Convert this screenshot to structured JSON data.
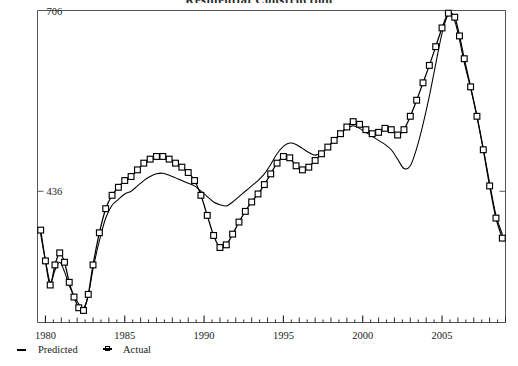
{
  "title": "Residential Construction",
  "legend": {
    "items": [
      {
        "label": "Predicted",
        "marker": "dash-marker",
        "color": "#000000"
      },
      {
        "label": "Actual",
        "marker": "square-marker",
        "color": "#000000"
      }
    ]
  },
  "axes": {
    "y_ticks": [
      "706",
      "436"
    ],
    "x_ticks": [
      "1980",
      "1985",
      "1990",
      "1995",
      "2000",
      "2005"
    ]
  },
  "chart_data": {
    "type": "line",
    "title": "Residential Construction",
    "xlabel": "",
    "ylabel": "",
    "xlim": [
      1979.5,
      2009.0
    ],
    "ylim": [
      240,
      706
    ],
    "ytick_values": [
      436,
      706
    ],
    "ytick_labels": [
      "436",
      "706"
    ],
    "xtick_values": [
      1980,
      1985,
      1990,
      1995,
      2000,
      2005
    ],
    "xtick_labels": [
      "1980",
      "1985",
      "1990",
      "1995",
      "2000",
      "2005"
    ],
    "minor_ticks": true,
    "grid": false,
    "legend_position": "below-left",
    "series": [
      {
        "name": "Predicted",
        "marker": "none",
        "color": "#000000",
        "x": [
          1979.7,
          1980.0,
          1980.3,
          1980.6,
          1980.9,
          1981.2,
          1981.5,
          1981.8,
          1982.1,
          1982.4,
          1982.7,
          1983.0,
          1983.4,
          1983.8,
          1984.2,
          1984.6,
          1985.0,
          1985.4,
          1985.8,
          1986.2,
          1986.6,
          1987.0,
          1987.4,
          1987.8,
          1988.2,
          1988.6,
          1989.0,
          1989.4,
          1989.8,
          1990.2,
          1990.6,
          1991.0,
          1991.4,
          1991.8,
          1992.2,
          1992.6,
          1993.0,
          1993.4,
          1993.8,
          1994.2,
          1994.6,
          1995.0,
          1995.4,
          1995.8,
          1996.2,
          1996.6,
          1997.0,
          1997.4,
          1997.8,
          1998.2,
          1998.6,
          1999.0,
          1999.4,
          1999.8,
          2000.2,
          2000.6,
          2001.0,
          2001.4,
          2001.8,
          2002.2,
          2002.6,
          2003.0,
          2003.4,
          2003.8,
          2004.2,
          2004.6,
          2005.0,
          2005.4,
          2005.8,
          2006.1,
          2006.4,
          2006.8,
          2007.2,
          2007.6,
          2008.0,
          2008.4,
          2008.8
        ],
        "y": [
          372,
          333,
          300,
          318,
          330,
          316,
          295,
          280,
          268,
          262,
          280,
          320,
          362,
          396,
          415,
          424,
          432,
          436,
          444,
          452,
          458,
          462,
          463,
          460,
          456,
          452,
          448,
          444,
          436,
          428,
          420,
          416,
          414,
          420,
          428,
          436,
          444,
          452,
          462,
          476,
          492,
          503,
          508,
          506,
          500,
          494,
          490,
          494,
          502,
          512,
          522,
          530,
          534,
          530,
          524,
          518,
          512,
          506,
          498,
          484,
          470,
          474,
          500,
          536,
          578,
          626,
          672,
          700,
          690,
          662,
          628,
          590,
          548,
          500,
          448,
          400,
          372
        ]
      },
      {
        "name": "Actual",
        "marker": "square",
        "color": "#000000",
        "x": [
          1979.7,
          1980.0,
          1980.3,
          1980.6,
          1980.9,
          1981.2,
          1981.5,
          1981.8,
          1982.1,
          1982.4,
          1982.7,
          1983.0,
          1983.4,
          1983.8,
          1984.2,
          1984.6,
          1985.0,
          1985.4,
          1985.8,
          1986.2,
          1986.6,
          1987.0,
          1987.4,
          1987.8,
          1988.2,
          1988.6,
          1989.0,
          1989.4,
          1989.8,
          1990.2,
          1990.6,
          1991.0,
          1991.4,
          1991.8,
          1992.2,
          1992.6,
          1993.0,
          1993.4,
          1993.8,
          1994.2,
          1994.6,
          1995.0,
          1995.4,
          1995.8,
          1996.2,
          1996.6,
          1997.0,
          1997.4,
          1997.8,
          1998.2,
          1998.6,
          1999.0,
          1999.4,
          1999.8,
          2000.2,
          2000.6,
          2001.0,
          2001.4,
          2001.8,
          2002.2,
          2002.6,
          2003.0,
          2003.4,
          2003.8,
          2004.2,
          2004.6,
          2005.0,
          2005.4,
          2005.8,
          2006.1,
          2006.4,
          2006.8,
          2007.2,
          2007.6,
          2008.0,
          2008.4,
          2008.8
        ],
        "y": [
          378,
          332,
          296,
          326,
          344,
          330,
          300,
          278,
          262,
          258,
          282,
          326,
          374,
          410,
          430,
          442,
          452,
          458,
          468,
          478,
          484,
          488,
          488,
          484,
          478,
          472,
          464,
          452,
          430,
          400,
          370,
          352,
          356,
          372,
          390,
          406,
          420,
          432,
          446,
          462,
          478,
          488,
          486,
          474,
          468,
          472,
          482,
          492,
          502,
          512,
          522,
          532,
          540,
          536,
          528,
          522,
          524,
          530,
          528,
          520,
          528,
          548,
          572,
          598,
          624,
          652,
          680,
          702,
          696,
          668,
          634,
          592,
          548,
          498,
          444,
          396,
          366
        ]
      }
    ]
  }
}
